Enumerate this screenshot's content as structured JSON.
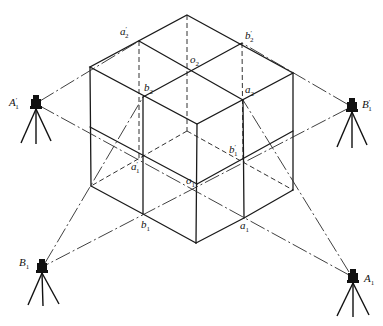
{
  "figure": {
    "title": "",
    "points": {
      "a2_prime": {
        "base": "a",
        "sub": "2",
        "prime": "′"
      },
      "b2_prime": {
        "base": "b",
        "sub": "2",
        "prime": "′"
      },
      "o2": {
        "base": "o",
        "sub": "2",
        "prime": ""
      },
      "b2": {
        "base": "b",
        "sub": "2",
        "prime": ""
      },
      "a2": {
        "base": "a",
        "sub": "2",
        "prime": ""
      },
      "a1_prime": {
        "base": "a",
        "sub": "1",
        "prime": "′"
      },
      "b1_prime": {
        "base": "b",
        "sub": "1",
        "prime": "′"
      },
      "o1": {
        "base": "o",
        "sub": "1",
        "prime": ""
      },
      "b1": {
        "base": "b",
        "sub": "1",
        "prime": ""
      },
      "a1": {
        "base": "a",
        "sub": "1",
        "prime": ""
      }
    },
    "instruments": {
      "A1_prime": {
        "base": "A",
        "sub": "1",
        "prime": "′",
        "icon": "theodolite-icon"
      },
      "B1_prime": {
        "base": "B",
        "sub": "1",
        "prime": "′",
        "icon": "theodolite-icon"
      },
      "B1": {
        "base": "B",
        "sub": "1",
        "prime": "",
        "icon": "theodolite-icon"
      },
      "A1": {
        "base": "A",
        "sub": "1",
        "prime": "",
        "icon": "theodolite-icon"
      }
    },
    "sight_lines": [
      {
        "from": "A1_prime",
        "to": "a2_prime"
      },
      {
        "from": "A1_prime",
        "to": "A1",
        "through": [
          "a1_prime",
          "o1",
          "a1"
        ]
      },
      {
        "from": "B1_prime",
        "to": "b2_prime"
      },
      {
        "from": "B1_prime",
        "to": "B1",
        "through": [
          "b1_prime",
          "o1",
          "b1"
        ]
      },
      {
        "from": "B1",
        "to": "b2"
      },
      {
        "from": "A1",
        "to": "a2"
      }
    ]
  }
}
